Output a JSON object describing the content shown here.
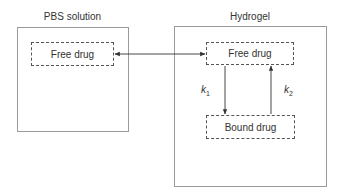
{
  "diagram": {
    "left_panel": {
      "title": "PBS solution",
      "node": "Free drug"
    },
    "right_panel": {
      "title": "Hydrogel",
      "top_node": "Free drug",
      "bottom_node": "Bound drug"
    },
    "edges": [
      {
        "from": "PBS solution / Free drug",
        "to": "Hydrogel / Free drug",
        "type": "bidirectional"
      },
      {
        "from": "Hydrogel / Free drug",
        "to": "Hydrogel / Bound drug",
        "label": "k",
        "label_sub": "1"
      },
      {
        "from": "Hydrogel / Bound drug",
        "to": "Hydrogel / Free drug",
        "label": "k",
        "label_sub": "2"
      }
    ],
    "colors": {
      "panel_border": "#9a9a9a",
      "box_border": "#555555",
      "arrow": "#333333",
      "text": "#333333"
    }
  }
}
